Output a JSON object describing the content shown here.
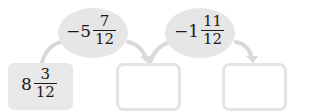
{
  "start_box": {
    "whole": "8",
    "numerator": "3",
    "denominator": "12"
  },
  "operations": [
    {
      "sign": "−",
      "whole": "5",
      "numerator": "7",
      "denominator": "12"
    },
    {
      "sign": "−",
      "whole": "1",
      "numerator": "11",
      "denominator": "12"
    }
  ],
  "answer_boxes": [
    {
      "value": ""
    },
    {
      "value": ""
    }
  ],
  "colors": {
    "filled": "#e8e8e8",
    "ellipse": "#e6e6e6",
    "arrow": "#d9d9d9",
    "border": "#e4e4e4"
  }
}
